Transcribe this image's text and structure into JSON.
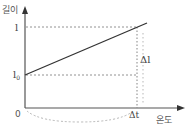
{
  "diagram": {
    "y_axis_label": "길이",
    "x_axis_label": "온도",
    "origin_label": "0",
    "l_label": "l",
    "l0_label": "l",
    "l0_subscript": "0",
    "delta_l_label": "Δl",
    "delta_t_label": "Δt",
    "colors": {
      "axis": "#555555",
      "line": "#333333",
      "dashed": "#777777",
      "text": "#555555"
    }
  }
}
